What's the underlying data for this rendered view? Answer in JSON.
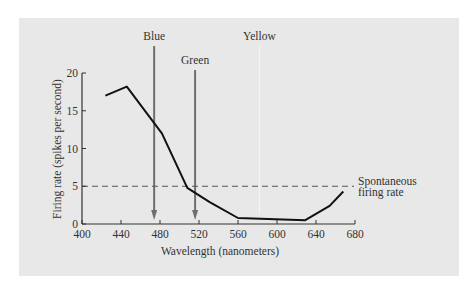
{
  "chart_data": {
    "type": "line",
    "title": "",
    "xlabel": "Wavelength (nanometers)",
    "ylabel": "Firing rate (spikes per second)",
    "xlim": [
      400,
      680
    ],
    "ylim": [
      0,
      20
    ],
    "x_ticks": [
      400,
      440,
      480,
      520,
      560,
      600,
      640,
      680
    ],
    "y_ticks": [
      0,
      5,
      10,
      15,
      20
    ],
    "grid": false,
    "series": [
      {
        "name": "Firing rate",
        "color": "#111111",
        "x": [
          424,
          446,
          482,
          508,
          531,
          560,
          629,
          654,
          668
        ],
        "y": [
          17,
          18.2,
          12,
          4.8,
          2.9,
          0.8,
          0.5,
          2.4,
          4.3
        ]
      }
    ],
    "reference_line": {
      "y": 5,
      "style": "dashed",
      "label": "Spontaneous firing rate",
      "label_lines": [
        "Spontaneous",
        "firing rate"
      ]
    },
    "annotations": [
      {
        "label": "Blue",
        "x": 474,
        "type": "arrow",
        "color": "#6e6e6e"
      },
      {
        "label": "Green",
        "x": 516,
        "type": "arrow",
        "color": "#6e6e6e"
      },
      {
        "label": "Yellow",
        "x": 582,
        "type": "arrow",
        "color": "#f6f6f6"
      }
    ],
    "colors": {
      "background": "#e8e8e8",
      "axis": "#333333",
      "curve": "#111111",
      "arrow": "#6e6e6e",
      "dashed": "#555555"
    }
  }
}
